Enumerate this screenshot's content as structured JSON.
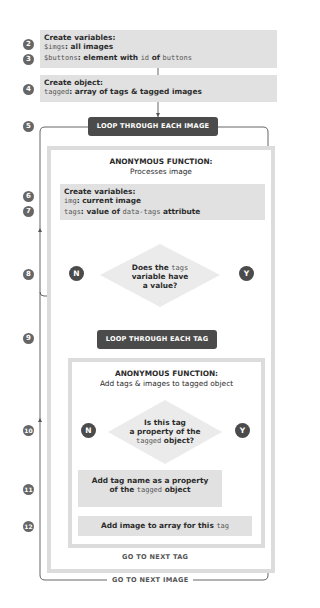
{
  "steps": [
    "2",
    "3",
    "4",
    "5",
    "6",
    "7",
    "8",
    "9",
    "10",
    "11",
    "12"
  ],
  "create_variables_1": {
    "heading": "Create variables:",
    "line1_code": "$imgs",
    "line1_text": ": all images",
    "line2_code": "$buttons",
    "line2_text_a": ": element with ",
    "line2_code_b": "id",
    "line2_text_c": " of ",
    "line2_code_d": "buttons"
  },
  "create_object": {
    "heading": "Create object:",
    "line_code": "tagged",
    "line_text": ": array of tags & tagged images"
  },
  "loop_images": {
    "label": "LOOP THROUGH EACH IMAGE",
    "footer": "GO TO NEXT IMAGE"
  },
  "function_1": {
    "title": "ANONYMOUS FUNCTION:",
    "subtitle": "Processes image",
    "vars": {
      "heading": "Create variables:",
      "line1_code": "img",
      "line1_text": ": current image",
      "line2_code": "tags",
      "line2_text_a": ": value of ",
      "line2_code_b": "data-tags",
      "line2_text_c": " attribute"
    },
    "decision": {
      "line1_a": "Does the ",
      "line1_code": "tags",
      "line2": "variable have",
      "line3": "a value?",
      "no": "N",
      "yes": "Y"
    }
  },
  "loop_tags": {
    "label": "LOOP THROUGH EACH TAG",
    "footer": "GO TO NEXT TAG"
  },
  "function_2": {
    "title": "ANONYMOUS FUNCTION:",
    "subtitle": "Add tags & images to tagged object",
    "decision": {
      "line1": "Is this tag",
      "line2": "a property of the",
      "line3_code": "tagged",
      "line3_text": " object?",
      "no": "N",
      "yes": "Y"
    },
    "add_property": {
      "line1": "Add tag name as a property",
      "line2_a": "of the ",
      "line2_code": "tagged",
      "line2_c": " object"
    },
    "add_image": {
      "text": "Add image to array for this ",
      "code": "tag"
    }
  },
  "colors": {
    "box_fill": "#e1e1e1",
    "pill_fill": "#4b4b4b",
    "frame_border": "#dcdcdc",
    "line": "#555555",
    "step_badge": "#666666"
  }
}
